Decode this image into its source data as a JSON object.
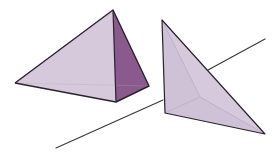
{
  "figure": {
    "title": "Two tetrahedra and a line",
    "colors": {
      "background": "#ffffff",
      "edge": "#2a2230",
      "light_face": "#d5c9db",
      "light_face_alt": "#cfc2d6",
      "dark_face": "#8a5a8c",
      "inner_edge": "#b7a6bf",
      "line": "#3a3a3a"
    },
    "left_tetrahedron": {
      "apex": [
        113,
        10
      ],
      "left": [
        15,
        83
      ],
      "front": [
        116,
        102
      ],
      "right": [
        149,
        86
      ]
    },
    "right_tetrahedron": {
      "top": [
        162,
        20
      ],
      "bottom_left": [
        165,
        113
      ],
      "bottom_right": [
        265,
        134
      ],
      "inner": [
        200,
        97
      ]
    },
    "line": {
      "start": [
        56,
        148
      ],
      "end": [
        265,
        39
      ],
      "hidden_from": [
        163,
        100
      ],
      "hidden_to": [
        208,
        70
      ]
    }
  }
}
